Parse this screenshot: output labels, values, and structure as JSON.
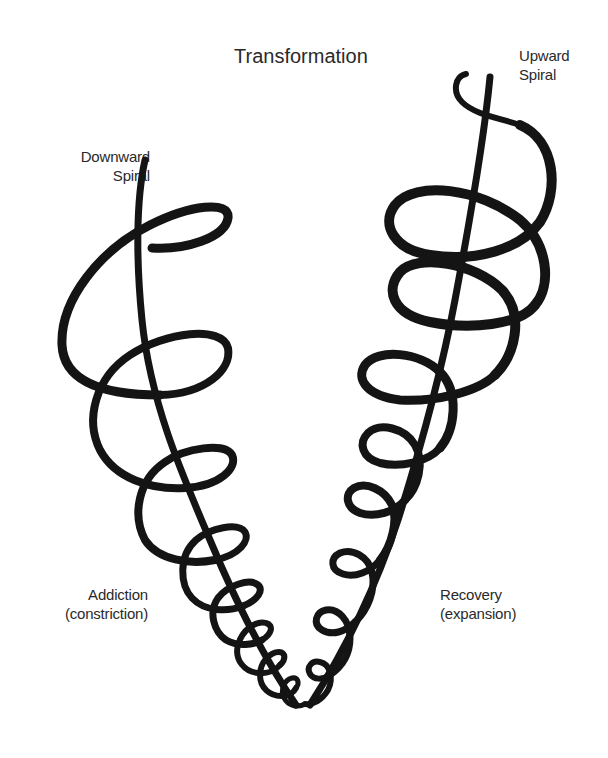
{
  "title": "Transformation",
  "labels": {
    "downward": {
      "line1": "Downward",
      "line2": "Spiral"
    },
    "upward": {
      "line1": "Upward",
      "line2": "Spiral"
    },
    "addiction": {
      "line1": "Addiction",
      "line2": "(constriction)"
    },
    "recovery": {
      "line1": "Recovery",
      "line2": "(expansion)"
    }
  },
  "colors": {
    "ink": "#141414",
    "text": "#2a2a2a",
    "background": "#ffffff"
  }
}
